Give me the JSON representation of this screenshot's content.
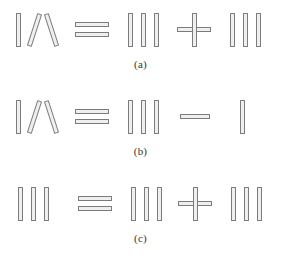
{
  "figure": {
    "stick_fill_color": "#efefef",
    "stick_border_color": "#7b7b7b",
    "background_color": "#ffffff",
    "caption_color": "#333333"
  },
  "rows": [
    {
      "id": "a",
      "caption": "(a)",
      "equation_text": "IV = III + III",
      "left_operand": "IV",
      "relation": "=",
      "operator": "+",
      "middle_operand": "III",
      "right_operand": "III"
    },
    {
      "id": "b",
      "caption": "(b)",
      "equation_text": "IV = III - I",
      "left_operand": "IV",
      "relation": "=",
      "operator": "-",
      "middle_operand": "III",
      "right_operand": "I"
    },
    {
      "id": "c",
      "caption": "(c)",
      "equation_text": "III = III + III",
      "left_operand": "III",
      "relation": "=",
      "operator": "+",
      "middle_operand": "III",
      "right_operand": "III"
    }
  ]
}
